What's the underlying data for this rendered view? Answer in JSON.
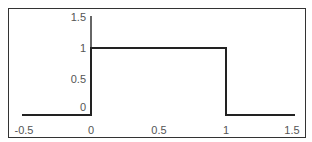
{
  "chart_data": {
    "type": "line",
    "title": "",
    "xlabel": "",
    "ylabel": "",
    "xlim": [
      -0.5,
      1.5
    ],
    "ylim": [
      0,
      1.5
    ],
    "grid": false,
    "legend": null,
    "x_ticks": [
      "-0.5",
      "0",
      "0.5",
      "1",
      "1.5"
    ],
    "y_ticks": [
      "0",
      "0.5",
      "1",
      "1.5"
    ],
    "series": [
      {
        "name": "rectangular pulse",
        "x": [
          -0.5,
          0,
          0,
          1,
          1,
          1.5
        ],
        "y": [
          0,
          0,
          1,
          1,
          0,
          0
        ]
      }
    ],
    "line_color": "#222222"
  },
  "axes": {
    "x_tick_labels": [
      "-0.5",
      "0",
      "0.5",
      "1",
      "1.5"
    ],
    "y_tick_labels": [
      "1.5",
      "1",
      "0.5",
      "0"
    ]
  }
}
